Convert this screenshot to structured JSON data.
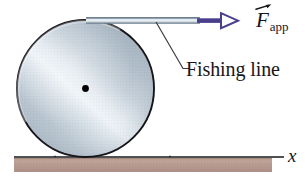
{
  "figure": {
    "colors": {
      "force_arrow": "#4a3f8c",
      "spool_outline": "#15151a",
      "spool_light": "#e8eef3",
      "spool_mid": "#b8c4cf",
      "spool_dark": "#8e9dab",
      "ground_fill": "#b79a91",
      "ground_line": "#17161a",
      "line_band_light": "#eef3f6",
      "line_band_edge": "#7d8c99",
      "hub_dot": "#000000",
      "leader_line": "#3b3b42",
      "text": "#18161a"
    }
  },
  "labels": {
    "force": {
      "symbol": "F",
      "subscript": "app",
      "vector_accent": "arrow-overbar",
      "icon": "vector-arrow-icon"
    },
    "fishing_line": "Fishing line",
    "axis_x": "x"
  },
  "geometry": {
    "spool": {
      "cx": 85.5,
      "cy": 88.5,
      "r": 68.5
    },
    "hub_dot": {
      "cx": 85.5,
      "cy": 88.5,
      "r": 3.4
    },
    "fishing_line_band": {
      "x1": 86,
      "x2": 200,
      "y": 20.5,
      "thickness": 6
    },
    "force_arrow": {
      "x1": 198,
      "x2": 238,
      "y": 21,
      "head_length": 16
    },
    "leader": {
      "x1": 156,
      "y1": 23,
      "x2": 183,
      "y2": 69
    },
    "ground_strip": {
      "x": 14,
      "y": 158,
      "width": 258,
      "height": 14
    },
    "ground_line": {
      "x1": 14,
      "x2": 284,
      "y": 157
    }
  }
}
